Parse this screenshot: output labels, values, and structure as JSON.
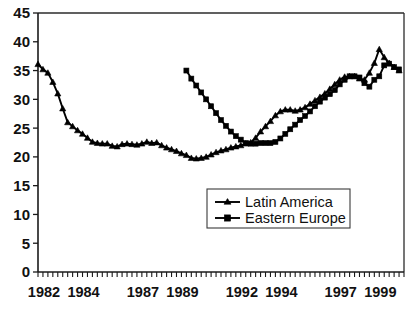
{
  "chart_data": {
    "type": "line",
    "title": "",
    "subtitle": "",
    "xlabel": "",
    "ylabel": "",
    "xlim": [
      1982,
      2000.5
    ],
    "ylim": [
      0,
      45
    ],
    "ytick_step": 5,
    "yticks": [
      0,
      5,
      10,
      15,
      20,
      25,
      30,
      35,
      40,
      45
    ],
    "xticks_labeled": [
      1982,
      1984,
      1987,
      1989,
      1992,
      1994,
      1997,
      1999
    ],
    "xtick_minor_interval_years": 0.25,
    "grid": false,
    "legend_position": "center-right-inside",
    "series": [
      {
        "name": "Latin America",
        "marker": "triangle",
        "color": "#000000",
        "x": [
          1982.0,
          1982.25,
          1982.5,
          1982.75,
          1983.0,
          1983.25,
          1983.5,
          1983.75,
          1984.0,
          1984.25,
          1984.5,
          1984.75,
          1985.0,
          1985.25,
          1985.5,
          1985.75,
          1986.0,
          1986.25,
          1986.5,
          1986.75,
          1987.0,
          1987.25,
          1987.5,
          1987.75,
          1988.0,
          1988.25,
          1988.5,
          1988.75,
          1989.0,
          1989.25,
          1989.5,
          1989.75,
          1990.0,
          1990.25,
          1990.5,
          1990.75,
          1991.0,
          1991.25,
          1991.5,
          1991.75,
          1992.0,
          1992.25,
          1992.5,
          1992.75,
          1993.0,
          1993.25,
          1993.5,
          1993.75,
          1994.0,
          1994.25,
          1994.5,
          1994.75,
          1995.0,
          1995.25,
          1995.5,
          1995.75,
          1996.0,
          1996.25,
          1996.5,
          1996.75,
          1997.0,
          1997.25,
          1997.5,
          1997.75,
          1998.0,
          1998.25,
          1998.5,
          1998.75,
          1999.0,
          1999.25,
          1999.5,
          1999.75,
          2000.0,
          2000.25
        ],
        "values": [
          36.1,
          35.2,
          34.6,
          33.0,
          31.0,
          28.4,
          26.0,
          25.3,
          24.6,
          24.0,
          23.3,
          22.6,
          22.4,
          22.3,
          22.3,
          21.9,
          21.8,
          22.2,
          22.3,
          22.2,
          22.1,
          22.3,
          22.6,
          22.4,
          22.5,
          22.0,
          21.6,
          21.3,
          21.0,
          20.6,
          20.3,
          19.8,
          19.7,
          19.8,
          20.0,
          20.4,
          20.8,
          21.1,
          21.3,
          21.6,
          21.8,
          22.0,
          22.3,
          22.5,
          23.3,
          24.4,
          25.3,
          26.2,
          27.2,
          27.9,
          28.2,
          28.2,
          28.0,
          28.2,
          28.6,
          29.2,
          29.8,
          30.4,
          31.0,
          31.8,
          32.6,
          33.4,
          33.9,
          34.0,
          34.0,
          33.6,
          33.4,
          34.6,
          36.3,
          38.7,
          37.3,
          36.3,
          35.6,
          35.0
        ]
      },
      {
        "name": "Eastern Europe",
        "marker": "square",
        "color": "#000000",
        "x": [
          1989.5,
          1989.75,
          1990.0,
          1990.25,
          1990.5,
          1990.75,
          1991.0,
          1991.25,
          1991.5,
          1991.75,
          1992.0,
          1992.25,
          1992.5,
          1992.75,
          1993.0,
          1993.25,
          1993.5,
          1993.75,
          1994.0,
          1994.25,
          1994.5,
          1994.75,
          1995.0,
          1995.25,
          1995.5,
          1995.75,
          1996.0,
          1996.25,
          1996.5,
          1996.75,
          1997.0,
          1997.25,
          1997.5,
          1997.75,
          1998.0,
          1998.25,
          1998.5,
          1998.75,
          1999.0,
          1999.25,
          1999.5,
          1999.75,
          2000.0,
          2000.25
        ],
        "values": [
          35.0,
          33.6,
          32.4,
          31.2,
          30.0,
          28.8,
          27.6,
          26.4,
          25.4,
          24.4,
          23.6,
          23.0,
          22.4,
          22.3,
          22.3,
          22.4,
          22.4,
          22.4,
          22.6,
          23.2,
          24.0,
          24.8,
          25.6,
          26.4,
          27.1,
          27.9,
          28.8,
          29.6,
          30.3,
          30.9,
          31.6,
          32.6,
          33.4,
          34.0,
          34.0,
          33.8,
          32.8,
          32.2,
          33.4,
          34.0,
          35.9,
          36.2,
          35.6,
          35.2
        ]
      }
    ]
  },
  "legend": {
    "items": [
      {
        "label": "Latin America",
        "marker": "triangle"
      },
      {
        "label": "Eastern Europe",
        "marker": "square"
      }
    ]
  },
  "axes": {
    "y_tick_labels": [
      "0",
      "5",
      "10",
      "15",
      "20",
      "25",
      "30",
      "35",
      "40",
      "45"
    ],
    "x_tick_labels": [
      "1982",
      "1984",
      "1987",
      "1989",
      "1992",
      "1994",
      "1997",
      "1999"
    ]
  }
}
